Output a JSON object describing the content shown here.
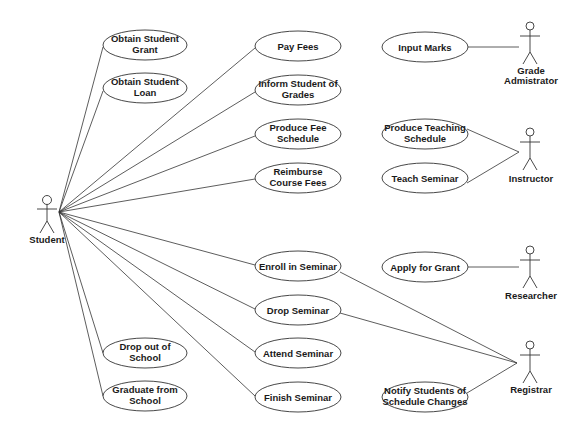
{
  "diagram": {
    "type": "uml-use-case",
    "actors": [
      {
        "id": "student",
        "label": "Student",
        "x": 47,
        "y": 200
      },
      {
        "id": "grade_admin",
        "label_lines": [
          "Grade",
          "Admistrator"
        ],
        "x": 530,
        "y": 45
      },
      {
        "id": "instructor",
        "label": "Instructor",
        "x": 530,
        "y": 135
      },
      {
        "id": "researcher",
        "label": "Researcher",
        "x": 530,
        "y": 266
      },
      {
        "id": "registrar",
        "label": "Registrar",
        "x": 530,
        "y": 357
      }
    ],
    "use_cases": [
      {
        "id": "obtain_grant",
        "lines": [
          "Obtain Student",
          "Grant"
        ],
        "cx": 145,
        "cy": 45,
        "rx": 42,
        "ry": 15
      },
      {
        "id": "obtain_loan",
        "lines": [
          "Obtain Student",
          "Loan"
        ],
        "cx": 145,
        "cy": 88,
        "rx": 42,
        "ry": 15
      },
      {
        "id": "drop_out",
        "lines": [
          "Drop out of",
          "School"
        ],
        "cx": 145,
        "cy": 353,
        "rx": 42,
        "ry": 15
      },
      {
        "id": "graduate",
        "lines": [
          "Graduate from",
          "School"
        ],
        "cx": 145,
        "cy": 396,
        "rx": 42,
        "ry": 15
      },
      {
        "id": "pay_fees",
        "lines": [
          "Pay Fees"
        ],
        "cx": 298,
        "cy": 46,
        "rx": 43,
        "ry": 15
      },
      {
        "id": "inform_grades",
        "lines": [
          "Inform Student of",
          "Grades"
        ],
        "cx": 298,
        "cy": 90,
        "rx": 43,
        "ry": 15
      },
      {
        "id": "produce_fee",
        "lines": [
          "Produce Fee",
          "Schedule"
        ],
        "cx": 298,
        "cy": 134,
        "rx": 43,
        "ry": 15
      },
      {
        "id": "reimburse",
        "lines": [
          "Reimburse",
          "Course Fees"
        ],
        "cx": 298,
        "cy": 178,
        "rx": 43,
        "ry": 15
      },
      {
        "id": "enroll",
        "lines": [
          "Enroll in Seminar"
        ],
        "cx": 298,
        "cy": 266,
        "rx": 43,
        "ry": 15
      },
      {
        "id": "drop_seminar",
        "lines": [
          "Drop Seminar"
        ],
        "cx": 298,
        "cy": 310,
        "rx": 43,
        "ry": 15
      },
      {
        "id": "attend",
        "lines": [
          "Attend Seminar"
        ],
        "cx": 298,
        "cy": 353,
        "rx": 43,
        "ry": 15
      },
      {
        "id": "finish",
        "lines": [
          "Finish Seminar"
        ],
        "cx": 298,
        "cy": 397,
        "rx": 43,
        "ry": 15
      },
      {
        "id": "input_marks",
        "lines": [
          "Input Marks"
        ],
        "cx": 425,
        "cy": 47,
        "rx": 43,
        "ry": 15
      },
      {
        "id": "produce_teaching",
        "lines": [
          "Produce Teaching",
          "Schedule"
        ],
        "cx": 425,
        "cy": 134,
        "rx": 43,
        "ry": 15
      },
      {
        "id": "teach",
        "lines": [
          "Teach Seminar"
        ],
        "cx": 425,
        "cy": 178,
        "rx": 43,
        "ry": 15
      },
      {
        "id": "apply_grant",
        "lines": [
          "Apply for Grant"
        ],
        "cx": 425,
        "cy": 267,
        "rx": 43,
        "ry": 15
      },
      {
        "id": "notify",
        "lines": [
          "Notify Students of",
          "Schedule Changes"
        ],
        "cx": 425,
        "cy": 397,
        "rx": 43,
        "ry": 15
      }
    ],
    "associations": [
      [
        "student",
        "obtain_grant"
      ],
      [
        "student",
        "obtain_loan"
      ],
      [
        "student",
        "drop_out"
      ],
      [
        "student",
        "graduate"
      ],
      [
        "student",
        "pay_fees"
      ],
      [
        "student",
        "inform_grades"
      ],
      [
        "student",
        "produce_fee"
      ],
      [
        "student",
        "reimburse"
      ],
      [
        "student",
        "enroll"
      ],
      [
        "student",
        "drop_seminar"
      ],
      [
        "student",
        "attend"
      ],
      [
        "student",
        "finish"
      ],
      [
        "grade_admin",
        "input_marks"
      ],
      [
        "instructor",
        "produce_teaching"
      ],
      [
        "instructor",
        "teach"
      ],
      [
        "researcher",
        "apply_grant"
      ],
      [
        "registrar",
        "enroll"
      ],
      [
        "registrar",
        "drop_seminar"
      ],
      [
        "registrar",
        "notify"
      ]
    ]
  },
  "labels": {
    "student": "Student",
    "grade_admin_1": "Grade",
    "grade_admin_2": "Admistrator",
    "instructor": "Instructor",
    "researcher": "Researcher",
    "registrar": "Registrar",
    "obtain_grant_1": "Obtain Student",
    "obtain_grant_2": "Grant",
    "obtain_loan_1": "Obtain Student",
    "obtain_loan_2": "Loan",
    "drop_out_1": "Drop out of",
    "drop_out_2": "School",
    "graduate_1": "Graduate from",
    "graduate_2": "School",
    "pay_fees": "Pay Fees",
    "inform_grades_1": "Inform Student of",
    "inform_grades_2": "Grades",
    "produce_fee_1": "Produce Fee",
    "produce_fee_2": "Schedule",
    "reimburse_1": "Reimburse",
    "reimburse_2": "Course Fees",
    "enroll": "Enroll in Seminar",
    "drop_seminar": "Drop Seminar",
    "attend": "Attend Seminar",
    "finish": "Finish Seminar",
    "input_marks": "Input Marks",
    "produce_teaching_1": "Produce Teaching",
    "produce_teaching_2": "Schedule",
    "teach": "Teach Seminar",
    "apply_grant": "Apply for Grant",
    "notify_1": "Notify Students of",
    "notify_2": "Schedule Changes"
  }
}
